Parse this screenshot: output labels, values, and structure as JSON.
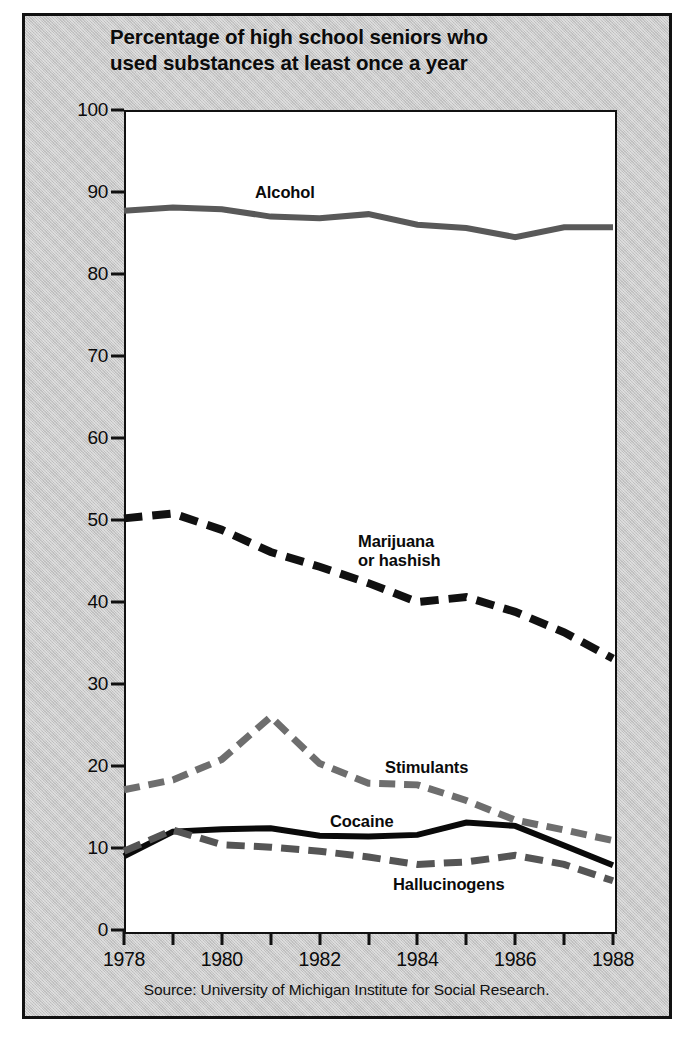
{
  "figure": {
    "title": "Percentage of high school seniors who\nused substances at least once a year",
    "source": "Source: University of Michigan Institute for Social Research.",
    "panel_color": "#c8c8c8",
    "plot_background": "#ffffff",
    "frame_color": "#111111"
  },
  "axes": {
    "y_ticks": [
      "0",
      "10",
      "20",
      "30",
      "40",
      "50",
      "60",
      "70",
      "80",
      "90",
      "100"
    ],
    "x_ticks": [
      "1978",
      "1980",
      "1982",
      "1984",
      "1986",
      "1988"
    ]
  },
  "annotations": [
    {
      "name": "alcohol",
      "text": "Alcohol"
    },
    {
      "name": "marijuana",
      "text": "Marijuana\nor hashish"
    },
    {
      "name": "stimulants",
      "text": "Stimulants"
    },
    {
      "name": "cocaine",
      "text": "Cocaine"
    },
    {
      "name": "hallucinogens",
      "text": "Hallucinogens"
    }
  ],
  "chart_data": {
    "type": "line",
    "title": "Percentage of high school seniors who used substances at least once a year",
    "subtitle": "",
    "xlabel": "",
    "ylabel": "",
    "xlim": [
      1978,
      1988
    ],
    "ylim": [
      0,
      100
    ],
    "ytick_step": 10,
    "xtick_step_minor": 1,
    "xtick_step_major": 2,
    "grid": false,
    "legend_position": "inline-labels",
    "source": "Source: University of Michigan Institute for Social Research.",
    "x": [
      1978,
      1979,
      1980,
      1981,
      1982,
      1983,
      1984,
      1985,
      1986,
      1987,
      1988
    ],
    "series": [
      {
        "name": "Alcohol",
        "color": "#595959",
        "style": "solid",
        "width": 6,
        "values": [
          87.7,
          88.1,
          87.9,
          87.0,
          86.8,
          87.3,
          86.0,
          85.6,
          84.5,
          85.7,
          85.7
        ]
      },
      {
        "name": "Marijuana or hashish",
        "color": "#111111",
        "style": "dashed",
        "width": 8,
        "values": [
          50.2,
          50.8,
          48.8,
          46.1,
          44.3,
          42.3,
          40.0,
          40.6,
          38.8,
          36.3,
          33.1
        ]
      },
      {
        "name": "Stimulants",
        "color": "#6e6e6e",
        "style": "dashed",
        "width": 7,
        "values": [
          17.1,
          18.3,
          20.8,
          26.0,
          20.3,
          17.9,
          17.7,
          15.8,
          13.4,
          12.2,
          10.9
        ]
      },
      {
        "name": "Cocaine",
        "color": "#0a0a0a",
        "style": "solid",
        "width": 6,
        "values": [
          9.0,
          12.0,
          12.3,
          12.4,
          11.5,
          11.4,
          11.6,
          13.1,
          12.7,
          10.3,
          7.9
        ]
      },
      {
        "name": "Hallucinogens",
        "color": "#555555",
        "style": "dash-dot",
        "width": 7,
        "values": [
          9.6,
          12.2,
          10.4,
          10.1,
          9.6,
          8.9,
          8.0,
          8.3,
          9.1,
          8.0,
          6.0
        ]
      }
    ]
  }
}
